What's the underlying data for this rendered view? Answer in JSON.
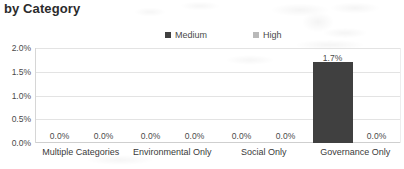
{
  "chart_data": {
    "type": "bar",
    "title": "by Category",
    "xlabel": "",
    "ylabel": "",
    "categories": [
      "Multiple Categories",
      "Environmental Only",
      "Social Only",
      "Governance Only"
    ],
    "series": [
      {
        "name": "Medium",
        "color": "#404040",
        "values": [
          0.0,
          0.0,
          0.0,
          1.7
        ],
        "labels": [
          "0.0%",
          "0.0%",
          "0.0%",
          "1.7%"
        ]
      },
      {
        "name": "High",
        "color": "#b9b9b9",
        "values": [
          0.0,
          0.0,
          0.0,
          0.0
        ],
        "labels": [
          "0.0%",
          "0.0%",
          "0.0%",
          "0.0%"
        ]
      }
    ],
    "ylim": [
      0,
      2.0
    ],
    "yticks": [
      0.0,
      0.5,
      1.0,
      1.5,
      2.0
    ],
    "ytick_labels": [
      "0.0%",
      "0.5%",
      "1.0%",
      "1.5%",
      "2.0%"
    ],
    "grid": true,
    "legend_position": "top-center"
  },
  "legend": {
    "items": [
      {
        "label": "Medium",
        "swatch": "#404040"
      },
      {
        "label": "High",
        "swatch": "#b9b9b9"
      }
    ]
  },
  "colors": {
    "medium": "#404040",
    "high": "#b9b9b9",
    "gridline": "#e3e3e3",
    "text": "#3a3a3a",
    "background": "#ffffff"
  }
}
